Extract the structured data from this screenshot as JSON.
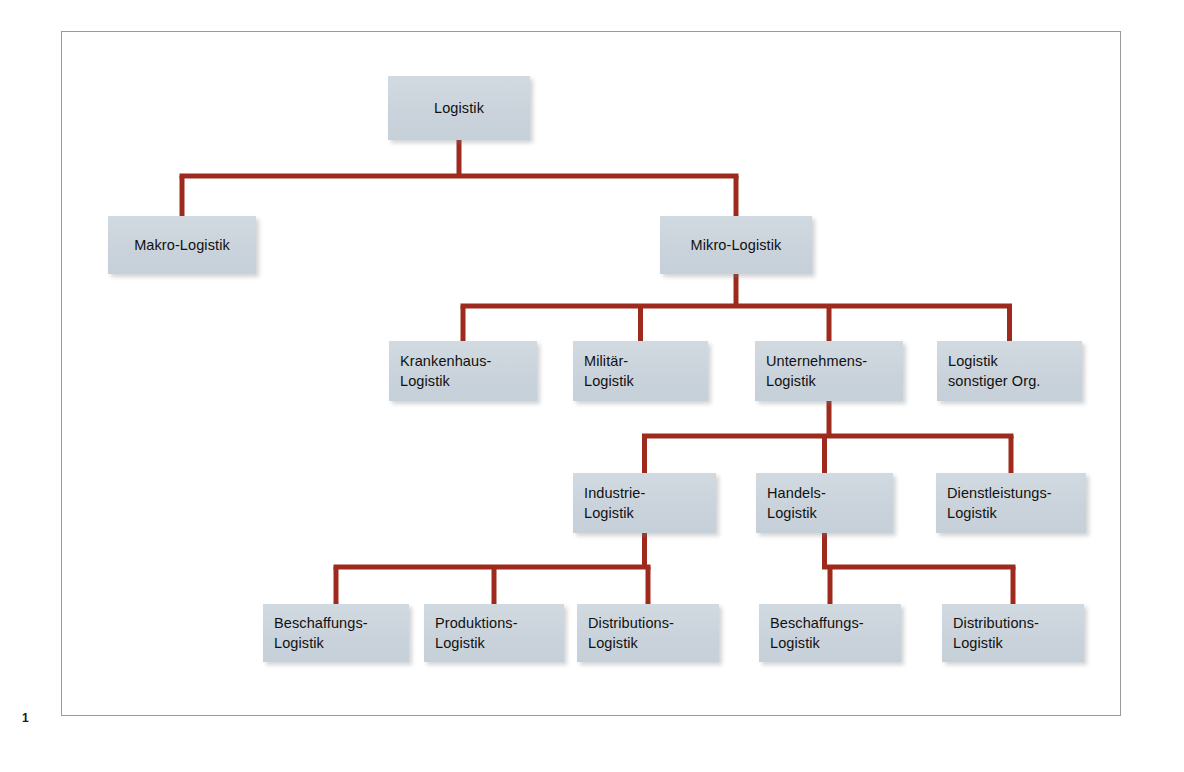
{
  "page": {
    "number": "1",
    "background_color": "#ffffff",
    "frame_color": "#9a9a9a"
  },
  "theme": {
    "node_fill": "#ccd5dd",
    "node_text": "#111111",
    "connector_color": "#9e2a1e",
    "connector_width": 5
  },
  "diagram": {
    "type": "tree",
    "title": "Logistik",
    "orientation": "top-down",
    "nodes": [
      {
        "id": "logistik",
        "label_line1": "Logistik",
        "label_line2": "",
        "align": "center",
        "x": 388,
        "y": 76,
        "w": 142,
        "h": 64
      },
      {
        "id": "makro-logistik",
        "label_line1": "Makro-Logistik",
        "label_line2": "",
        "align": "center",
        "x": 108,
        "y": 216,
        "w": 148,
        "h": 58
      },
      {
        "id": "mikro-logistik",
        "label_line1": "Mikro-Logistik",
        "label_line2": "",
        "align": "center",
        "x": 660,
        "y": 216,
        "w": 152,
        "h": 58
      },
      {
        "id": "krankenhaus-logistik",
        "label_line1": "Krankenhaus-",
        "label_line2": "Logistik",
        "align": "left",
        "x": 389,
        "y": 341,
        "w": 148,
        "h": 60
      },
      {
        "id": "militaer-logistik",
        "label_line1": "Militär-",
        "label_line2": "Logistik",
        "align": "left",
        "x": 573,
        "y": 341,
        "w": 135,
        "h": 60
      },
      {
        "id": "unternehmens-logistik",
        "label_line1": "Unternehmens-",
        "label_line2": "Logistik",
        "align": "left",
        "x": 755,
        "y": 341,
        "w": 148,
        "h": 60
      },
      {
        "id": "logistik-sonstiger",
        "label_line1": "Logistik",
        "label_line2": "sonstiger Org.",
        "align": "left",
        "x": 937,
        "y": 341,
        "w": 145,
        "h": 60
      },
      {
        "id": "industrie-logistik",
        "label_line1": "Industrie-",
        "label_line2": "Logistik",
        "align": "left",
        "x": 573,
        "y": 473,
        "w": 143,
        "h": 60
      },
      {
        "id": "handels-logistik",
        "label_line1": "Handels-",
        "label_line2": "Logistik",
        "align": "left",
        "x": 756,
        "y": 473,
        "w": 137,
        "h": 60
      },
      {
        "id": "dienstleistungs-logistik",
        "label_line1": "Dienstleistungs-",
        "label_line2": "Logistik",
        "align": "left",
        "x": 936,
        "y": 473,
        "w": 150,
        "h": 60
      },
      {
        "id": "beschaffungs-logistik-i",
        "label_line1": "Beschaffungs-",
        "label_line2": "Logistik",
        "align": "left",
        "x": 263,
        "y": 604,
        "w": 146,
        "h": 58
      },
      {
        "id": "produktions-logistik",
        "label_line1": "Produktions-",
        "label_line2": "Logistik",
        "align": "left",
        "x": 424,
        "y": 604,
        "w": 140,
        "h": 58
      },
      {
        "id": "distributions-logistik-i",
        "label_line1": "Distributions-",
        "label_line2": "Logistik",
        "align": "left",
        "x": 577,
        "y": 604,
        "w": 142,
        "h": 58
      },
      {
        "id": "beschaffungs-logistik-h",
        "label_line1": "Beschaffungs-",
        "label_line2": "Logistik",
        "align": "left",
        "x": 759,
        "y": 604,
        "w": 142,
        "h": 58
      },
      {
        "id": "distributions-logistik-h",
        "label_line1": "Distributions-",
        "label_line2": "Logistik",
        "align": "left",
        "x": 942,
        "y": 604,
        "w": 142,
        "h": 58
      }
    ],
    "edges": [
      {
        "from": "logistik",
        "to": [
          "makro-logistik",
          "mikro-logistik"
        ]
      },
      {
        "from": "mikro-logistik",
        "to": [
          "krankenhaus-logistik",
          "militaer-logistik",
          "unternehmens-logistik",
          "logistik-sonstiger"
        ]
      },
      {
        "from": "unternehmens-logistik",
        "to": [
          "industrie-logistik",
          "handels-logistik",
          "dienstleistungs-logistik"
        ]
      },
      {
        "from": "industrie-logistik",
        "to": [
          "beschaffungs-logistik-i",
          "produktions-logistik",
          "distributions-logistik-i"
        ]
      },
      {
        "from": "handels-logistik",
        "to": [
          "beschaffungs-logistik-h",
          "distributions-logistik-h"
        ]
      }
    ]
  }
}
